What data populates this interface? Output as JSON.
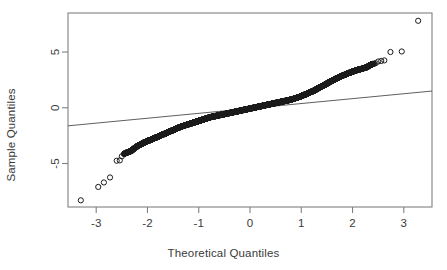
{
  "chart_data": {
    "type": "scatter",
    "title": "",
    "xlabel": "Theoretical Quantiles",
    "ylabel": "Sample Quantiles",
    "xlim": [
      -3.55,
      3.55
    ],
    "ylim": [
      -8.9,
      8.5
    ],
    "xticks": [
      -3,
      -2,
      -1,
      0,
      1,
      2,
      3
    ],
    "xticklabels": [
      "-3",
      "-2",
      "-1",
      "0",
      "1",
      "2",
      "3"
    ],
    "yticks": [
      -5,
      0,
      5
    ],
    "yticklabels": [
      "-5",
      "0",
      "5"
    ],
    "grid": false,
    "legend": null,
    "marker": "open-circle",
    "marker_color": "#1a1a1a",
    "box_color": "#808080",
    "reference_line": {
      "name": "qqline",
      "color": "#4d4d4d",
      "x": [
        -3.55,
        3.55
      ],
      "y": [
        -1.62,
        1.5
      ]
    },
    "x": [
      -3.3,
      -2.96,
      -2.85,
      -2.73,
      -2.6,
      -2.54,
      -2.5,
      -2.46,
      -2.42,
      -2.38,
      -2.34,
      -2.31,
      -2.28,
      -2.25,
      -2.22,
      -2.19,
      -2.16,
      -2.13,
      -2.11,
      -2.08,
      -2.06,
      -2.03,
      -2.01,
      -1.99,
      -1.96,
      -1.94,
      -1.92,
      -1.9,
      -1.88,
      -1.86,
      -1.84,
      -1.82,
      -1.8,
      -1.78,
      -1.76,
      -1.74,
      -1.72,
      -1.7,
      -1.68,
      -1.66,
      -1.64,
      -1.62,
      -1.6,
      -1.58,
      -1.56,
      -1.54,
      -1.52,
      -1.5,
      -1.48,
      -1.46,
      -1.44,
      -1.42,
      -1.4,
      -1.38,
      -1.36,
      -1.34,
      -1.32,
      -1.3,
      -1.28,
      -1.26,
      -1.24,
      -1.22,
      -1.2,
      -1.18,
      -1.16,
      -1.14,
      -1.12,
      -1.1,
      -1.08,
      -1.06,
      -1.04,
      -1.02,
      -1.0,
      -0.98,
      -0.96,
      -0.94,
      -0.92,
      -0.9,
      -0.88,
      -0.86,
      -0.84,
      -0.82,
      -0.8,
      -0.78,
      -0.76,
      -0.74,
      -0.72,
      -0.7,
      -0.68,
      -0.66,
      -0.64,
      -0.62,
      -0.6,
      -0.58,
      -0.56,
      -0.54,
      -0.52,
      -0.5,
      -0.48,
      -0.46,
      -0.44,
      -0.42,
      -0.4,
      -0.38,
      -0.36,
      -0.34,
      -0.32,
      -0.3,
      -0.28,
      -0.26,
      -0.24,
      -0.22,
      -0.2,
      -0.18,
      -0.16,
      -0.14,
      -0.12,
      -0.1,
      -0.08,
      -0.06,
      -0.04,
      -0.02,
      0.0,
      0.02,
      0.04,
      0.06,
      0.08,
      0.1,
      0.12,
      0.14,
      0.16,
      0.18,
      0.2,
      0.22,
      0.24,
      0.26,
      0.28,
      0.3,
      0.32,
      0.34,
      0.36,
      0.38,
      0.4,
      0.42,
      0.44,
      0.46,
      0.48,
      0.5,
      0.52,
      0.54,
      0.56,
      0.58,
      0.6,
      0.62,
      0.64,
      0.66,
      0.68,
      0.7,
      0.72,
      0.74,
      0.76,
      0.78,
      0.8,
      0.82,
      0.84,
      0.86,
      0.88,
      0.9,
      0.92,
      0.94,
      0.96,
      0.98,
      1.0,
      1.02,
      1.04,
      1.06,
      1.08,
      1.1,
      1.12,
      1.14,
      1.16,
      1.18,
      1.2,
      1.22,
      1.24,
      1.26,
      1.28,
      1.3,
      1.32,
      1.34,
      1.36,
      1.38,
      1.4,
      1.42,
      1.44,
      1.46,
      1.48,
      1.5,
      1.52,
      1.54,
      1.56,
      1.58,
      1.6,
      1.62,
      1.64,
      1.66,
      1.68,
      1.7,
      1.73,
      1.76,
      1.79,
      1.82,
      1.85,
      1.88,
      1.91,
      1.94,
      1.97,
      2.0,
      2.03,
      2.06,
      2.09,
      2.12,
      2.15,
      2.18,
      2.21,
      2.24,
      2.27,
      2.3,
      2.33,
      2.36,
      2.39,
      2.42,
      2.45,
      2.5,
      2.56,
      2.62,
      2.74,
      2.96,
      3.28
    ],
    "y": [
      -8.3,
      -7.1,
      -6.7,
      -6.25,
      -4.75,
      -4.72,
      -4.35,
      -4.15,
      -4.05,
      -3.98,
      -3.92,
      -3.85,
      -3.72,
      -3.62,
      -3.52,
      -3.42,
      -3.35,
      -3.28,
      -3.22,
      -3.16,
      -3.1,
      -3.05,
      -3.0,
      -2.96,
      -2.92,
      -2.88,
      -2.84,
      -2.8,
      -2.76,
      -2.72,
      -2.68,
      -2.64,
      -2.6,
      -2.56,
      -2.52,
      -2.48,
      -2.44,
      -2.4,
      -2.36,
      -2.32,
      -2.28,
      -2.24,
      -2.2,
      -2.16,
      -2.12,
      -2.08,
      -2.04,
      -2.0,
      -1.96,
      -1.92,
      -1.88,
      -1.84,
      -1.8,
      -1.76,
      -1.72,
      -1.69,
      -1.66,
      -1.63,
      -1.6,
      -1.57,
      -1.54,
      -1.51,
      -1.48,
      -1.45,
      -1.42,
      -1.39,
      -1.36,
      -1.33,
      -1.3,
      -1.27,
      -1.24,
      -1.21,
      -1.18,
      -1.15,
      -1.12,
      -1.09,
      -1.06,
      -1.03,
      -1.0,
      -0.97,
      -0.94,
      -0.91,
      -0.88,
      -0.85,
      -0.83,
      -0.81,
      -0.79,
      -0.77,
      -0.75,
      -0.73,
      -0.71,
      -0.69,
      -0.67,
      -0.65,
      -0.63,
      -0.61,
      -0.59,
      -0.57,
      -0.55,
      -0.53,
      -0.51,
      -0.49,
      -0.47,
      -0.45,
      -0.43,
      -0.41,
      -0.39,
      -0.37,
      -0.35,
      -0.33,
      -0.31,
      -0.29,
      -0.27,
      -0.25,
      -0.23,
      -0.21,
      -0.19,
      -0.17,
      -0.15,
      -0.13,
      -0.11,
      -0.09,
      -0.07,
      -0.05,
      -0.03,
      -0.01,
      0.01,
      0.03,
      0.05,
      0.07,
      0.09,
      0.11,
      0.13,
      0.15,
      0.17,
      0.19,
      0.21,
      0.23,
      0.25,
      0.27,
      0.29,
      0.31,
      0.33,
      0.35,
      0.37,
      0.39,
      0.41,
      0.43,
      0.45,
      0.47,
      0.49,
      0.51,
      0.53,
      0.55,
      0.57,
      0.59,
      0.61,
      0.63,
      0.65,
      0.67,
      0.69,
      0.71,
      0.73,
      0.76,
      0.79,
      0.82,
      0.85,
      0.88,
      0.91,
      0.94,
      0.97,
      1.0,
      1.04,
      1.08,
      1.12,
      1.16,
      1.2,
      1.24,
      1.28,
      1.32,
      1.36,
      1.4,
      1.44,
      1.48,
      1.52,
      1.57,
      1.62,
      1.67,
      1.72,
      1.77,
      1.82,
      1.87,
      1.92,
      1.97,
      2.02,
      2.07,
      2.12,
      2.17,
      2.22,
      2.27,
      2.32,
      2.37,
      2.42,
      2.47,
      2.52,
      2.57,
      2.62,
      2.67,
      2.73,
      2.79,
      2.85,
      2.91,
      2.97,
      3.03,
      3.09,
      3.14,
      3.19,
      3.24,
      3.29,
      3.34,
      3.38,
      3.42,
      3.46,
      3.5,
      3.54,
      3.58,
      3.62,
      3.7,
      3.78,
      3.86,
      3.92,
      3.96,
      4.0,
      4.15,
      4.2,
      4.25,
      5.0,
      5.05,
      7.8
    ]
  }
}
